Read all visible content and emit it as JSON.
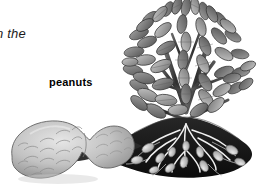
{
  "figure": {
    "type": "botanical-illustration",
    "style": "grayscale pencil drawing",
    "background_color": "#ffffff",
    "width": 258,
    "height": 191
  },
  "labels": {
    "caption_fragment": "n the",
    "peanuts_label": "peanuts"
  },
  "illustration": {
    "parts": [
      {
        "name": "foliage",
        "description": "bushy cluster of pointed leaves",
        "color": "#8f8f8f"
      },
      {
        "name": "stems",
        "description": "upright branching stems",
        "color": "#4a4a4a"
      },
      {
        "name": "soil-mound",
        "description": "dark earth mound cut away",
        "color": "#1c1c1c"
      },
      {
        "name": "roots",
        "description": "white fibrous root network",
        "color": "#f2f2f2"
      },
      {
        "name": "underground-pods",
        "description": "peanut pods attached to roots",
        "color": "#cfcfcf"
      },
      {
        "name": "peanut-shell",
        "description": "large magnified peanut shell",
        "color": "#bdbdbd"
      }
    ]
  },
  "colors": {
    "leaf_light": "#b4b4b4",
    "leaf_mid": "#8c8c8c",
    "leaf_dark": "#5e5e5e",
    "outline": "#3a3a3a",
    "soil": "#141414",
    "root": "#f5f5f5",
    "pod": "#d2d2d2",
    "shell_light": "#d8d8d8",
    "shell_mid": "#b0b0b0",
    "shell_dark": "#7d7d7d",
    "text": "#111111"
  }
}
